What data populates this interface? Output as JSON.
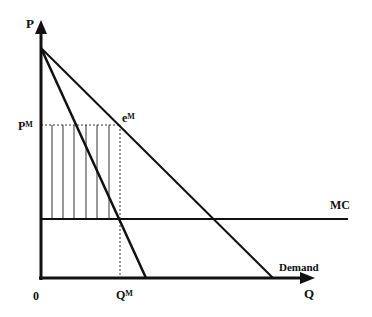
{
  "diagram": {
    "type": "monopoly-deadweight-diagram",
    "axes": {
      "y_label": "P",
      "x_label": "Q",
      "origin_label": "0"
    },
    "labels": {
      "price_monopoly": "P",
      "price_monopoly_sup": "M",
      "quantity_monopoly": "Q",
      "quantity_monopoly_sup": "M",
      "equilibrium": "e",
      "equilibrium_sup": "M",
      "marginal_cost": "MC",
      "demand": "Demand"
    },
    "colors": {
      "line": "#111111",
      "hatch": "#333333",
      "background": "#ffffff"
    },
    "geometry": {
      "origin": [
        41,
        278
      ],
      "y_axis_top": 22,
      "x_axis_right": 314,
      "intercept": [
        41,
        48
      ],
      "demand_x_intercept": 273,
      "mr_x_intercept": 146,
      "mc_y": 219,
      "mc_x_end": 348,
      "pm_y": 125,
      "qm_x": 120,
      "hatch_x": [
        52,
        63,
        74,
        86,
        97,
        109
      ]
    }
  }
}
